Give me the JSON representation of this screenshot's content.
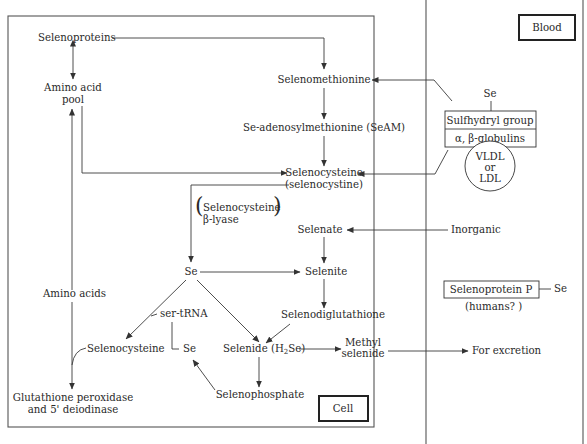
{
  "figure": {
    "regions": {
      "cell_label": "Cell",
      "blood_label": "Blood"
    }
  },
  "nodes": {
    "selenoproteins": "Selenoproteins",
    "amino_acid_pool_1": "Amino acid",
    "amino_acid_pool_2": "pool",
    "selenomethionine": "Selenomethionine",
    "seam": "Se-adenosylmethionine (SeAM)",
    "selenocysteine_top_1": "Selenocysteine",
    "selenocysteine_top_2": "(selenocystine)",
    "enzyme_1": "Selenocysteine",
    "enzyme_2": "β-lyase",
    "selenate": "Selenate",
    "inorganic": "Inorganic",
    "se_center": "Se",
    "selenite": "Selenite",
    "selenodiglutathione": "Selenodiglutathione",
    "amino_acids": "Amino acids",
    "ser_trna": "ser-tRNA",
    "selenocysteine_low": "Selenocysteine",
    "se_small": "Se",
    "selenide": "Selenide (H",
    "selenide_sub": "2",
    "selenide_end": "Se)",
    "methyl_selenide_1": "Methyl",
    "methyl_selenide_2": "selenide",
    "for_excretion": "For excretion",
    "selenophosphate": "Selenophosphate",
    "glutathione_1": "Glutathione peroxidase",
    "glutathione_2": "and 5' deiodinase"
  },
  "blood": {
    "se_top": "Se",
    "sulfhydryl": "Sulfhydryl group",
    "globulins": "α, β-globulins",
    "vldl_1": "VLDL",
    "vldl_2": "or",
    "vldl_3": "LDL",
    "selenoprotein_p": "Selenoprotein P",
    "se_right": "Se",
    "humans": "(humans? )"
  },
  "colors": {
    "line": "#3a3a3a",
    "text": "#2a2a2a",
    "background": "#ffffff"
  }
}
